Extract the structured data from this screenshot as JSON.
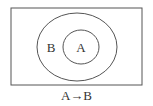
{
  "diagram": {
    "type": "euler-diagram",
    "universe": {
      "x": 11,
      "y": 8,
      "width": 131,
      "height": 77
    },
    "sets": [
      {
        "label": "B",
        "cx": 77,
        "cy": 47,
        "rx": 40,
        "ry": 34,
        "label_x": 51,
        "label_y": 52
      },
      {
        "label": "A",
        "cx": 81,
        "cy": 47,
        "rx": 18,
        "ry": 17,
        "label_x": 81,
        "label_y": 52
      }
    ],
    "relation": "A subset of B",
    "caption": "A→B",
    "stroke_color": "#555555"
  }
}
